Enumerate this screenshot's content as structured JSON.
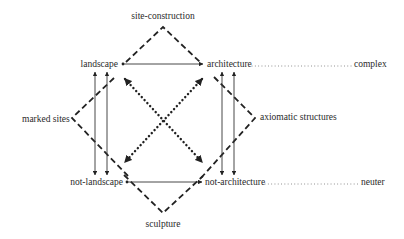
{
  "diagram": {
    "type": "Klein group expansion (expanded field diagram)",
    "nodes": {
      "top_left": "landscape",
      "top_right": "architecture",
      "bottom_left": "not-landscape",
      "bottom_right": "not-architecture"
    },
    "complex_terms": {
      "top": "site-construction",
      "bottom": "sculpture",
      "left": "marked sites",
      "right": "axiomatic structures"
    },
    "leaders": {
      "top_right_term": "complex",
      "bottom_right_term": "neuter"
    },
    "edges": [
      {
        "from": "landscape",
        "to": "architecture",
        "style": "solid-arrow"
      },
      {
        "from": "not-landscape",
        "to": "not-architecture",
        "style": "solid-arrow"
      },
      {
        "from": "landscape",
        "to": "not-landscape",
        "style": "double-vertical-arrows"
      },
      {
        "from": "architecture",
        "to": "not-architecture",
        "style": "double-vertical-arrows"
      },
      {
        "from": "landscape",
        "to": "not-architecture",
        "style": "dotted-diagonal-arrow"
      },
      {
        "from": "architecture",
        "to": "not-landscape",
        "style": "dotted-diagonal-arrow"
      },
      {
        "from": "landscape",
        "to": "architecture",
        "via": "site-construction",
        "style": "dashed-chevron"
      },
      {
        "from": "not-landscape",
        "to": "not-architecture",
        "via": "sculpture",
        "style": "dashed-chevron"
      },
      {
        "from": "landscape",
        "to": "not-landscape",
        "via": "marked sites",
        "style": "dashed-chevron"
      },
      {
        "from": "architecture",
        "to": "not-architecture",
        "via": "axiomatic structures",
        "style": "dashed-chevron"
      }
    ]
  }
}
